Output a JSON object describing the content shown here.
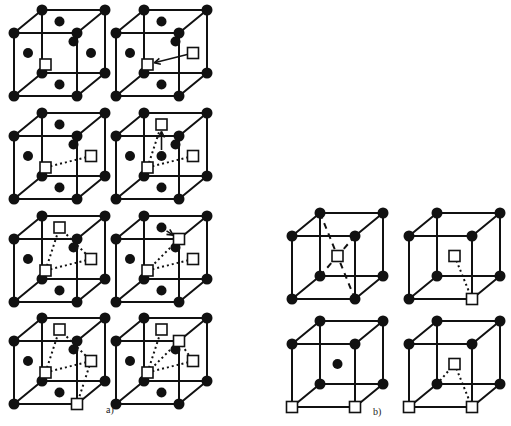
{
  "figure": {
    "panel_a": {
      "label": "a)",
      "lattice": "face-centered cubic",
      "cells": [
        {
          "id": "a1",
          "vacancies": [
            "front-face-center"
          ],
          "jumps": [],
          "links": []
        },
        {
          "id": "a2",
          "vacancies": [
            "front-face-center",
            "right-face-center"
          ],
          "jumps": [
            {
              "from": "right-face-center",
              "to": "front-face-center"
            }
          ],
          "links": []
        },
        {
          "id": "a3",
          "vacancies": [
            "front-face-center",
            "right-face-center"
          ],
          "jumps": [],
          "links": [
            [
              "front-face-center",
              "right-face-center"
            ]
          ]
        },
        {
          "id": "a4",
          "vacancies": [
            "front-face-center",
            "right-face-center",
            "top-face-center"
          ],
          "jumps": [
            {
              "from": "center",
              "to": "top-face-center"
            }
          ],
          "links": [
            [
              "front-face-center",
              "right-face-center"
            ],
            [
              "front-face-center",
              "top-face-center"
            ]
          ]
        },
        {
          "id": "a5",
          "vacancies": [
            "front-face-center",
            "right-face-center",
            "top-face-center"
          ],
          "jumps": [],
          "links": [
            [
              "front-face-center",
              "right-face-center"
            ],
            [
              "front-face-center",
              "top-face-center"
            ],
            [
              "top-face-center",
              "right-face-center"
            ]
          ]
        },
        {
          "id": "a6",
          "vacancies": [
            "front-face-center",
            "right-face-center",
            "top-right-front-corner"
          ],
          "jumps": [
            {
              "from": "top-face-center",
              "to": "top-right-front-corner"
            }
          ],
          "links": [
            [
              "front-face-center",
              "right-face-center"
            ],
            [
              "front-face-center",
              "top-right-front-corner"
            ]
          ]
        },
        {
          "id": "a7",
          "vacancies": [
            "front-face-center",
            "right-face-center",
            "top-face-center",
            "bottom-right-front-corner"
          ],
          "jumps": [],
          "links": [
            [
              "front-face-center",
              "right-face-center"
            ],
            [
              "front-face-center",
              "top-face-center"
            ],
            [
              "top-face-center",
              "right-face-center"
            ],
            [
              "right-face-center",
              "bottom-right-front-corner"
            ]
          ]
        },
        {
          "id": "a8",
          "vacancies": [
            "front-face-center",
            "right-face-center",
            "top-face-center",
            "top-right-front-corner"
          ],
          "jumps": [],
          "links": [
            [
              "front-face-center",
              "top-face-center"
            ],
            [
              "front-face-center",
              "top-right-front-corner"
            ],
            [
              "front-face-center",
              "right-face-center"
            ],
            [
              "top-right-front-corner",
              "right-face-center"
            ]
          ]
        }
      ]
    },
    "panel_b": {
      "label": "b)",
      "lattice": "body-centered cubic",
      "cells": [
        {
          "id": "b1",
          "vacancies": [
            "center"
          ],
          "body_diagonals": true
        },
        {
          "id": "b2",
          "vacancies": [
            "center",
            "bottom-right-front-corner"
          ]
        },
        {
          "id": "b3",
          "vacancies": [
            "bottom-left-front-corner",
            "bottom-right-front-corner"
          ],
          "center_atom": true
        },
        {
          "id": "b4",
          "vacancies": [
            "center",
            "bottom-left-front-corner",
            "bottom-right-front-corner"
          ]
        }
      ]
    }
  }
}
